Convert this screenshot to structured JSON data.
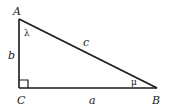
{
  "diagram": {
    "vertices": [
      {
        "id": "A",
        "label": "A",
        "x": 19,
        "y": 19
      },
      {
        "id": "B",
        "label": "B",
        "x": 157,
        "y": 88
      },
      {
        "id": "C",
        "label": "C",
        "x": 19,
        "y": 88
      }
    ],
    "sides": {
      "a": {
        "label": "a",
        "from": "C",
        "to": "B"
      },
      "b": {
        "label": "b",
        "from": "A",
        "to": "C"
      },
      "c": {
        "label": "c",
        "from": "A",
        "to": "B"
      }
    },
    "angles": {
      "lambda": {
        "label": "λ",
        "at": "A"
      },
      "mu": {
        "label": "μ",
        "at": "B"
      },
      "right": {
        "label": "",
        "at": "C"
      }
    },
    "colors": {
      "stroke": "#1a1a1a",
      "background": "#ffffff"
    }
  }
}
